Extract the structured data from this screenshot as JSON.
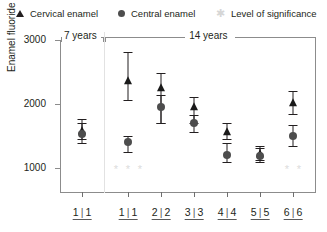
{
  "legend": {
    "items": [
      {
        "marker": "triangle-marker",
        "label": "Cervical enamel"
      },
      {
        "marker": "circle-marker",
        "label": "Central enamel"
      },
      {
        "marker": "asterisk-marker",
        "label": "Level of significance"
      }
    ]
  },
  "axes": {
    "ylabel": "Enamel fluoride (ppm)",
    "yticks": [
      1000,
      2000,
      3000
    ],
    "ytick_labels": [
      "1000",
      "2000",
      "3000"
    ],
    "ylim": [
      600,
      3000
    ],
    "xlim": [
      0,
      7
    ],
    "xtick_labels": [
      "1|1",
      "1|1",
      "2|2",
      "3|3",
      "4|4",
      "5|5",
      "6|6"
    ]
  },
  "groups": [
    {
      "header": "7 years"
    },
    {
      "header": "14 years"
    }
  ],
  "colors": {
    "cervical": "#1a1a1a",
    "central": "#4d4d4d",
    "significance": "#dcdcdc",
    "axis": "#8c8c8c"
  },
  "chart_data": {
    "type": "scatter",
    "title": "",
    "xlabel": "",
    "ylabel": "Enamel fluoride (ppm)",
    "ylim": [
      600,
      3000
    ],
    "grid": false,
    "legend_position": "top",
    "categories": [
      "1|1",
      "1|1",
      "2|2",
      "3|3",
      "4|4",
      "5|5",
      "6|6"
    ],
    "group_headers": [
      "7 years",
      "14 years"
    ],
    "group_spans": [
      [
        0,
        0
      ],
      [
        1,
        6
      ]
    ],
    "series": [
      {
        "name": "Cervical enamel",
        "marker": "triangle",
        "values": [
          1570,
          2350,
          2250,
          1950,
          1550,
          1210,
          2010
        ],
        "err_high": [
          1760,
          2810,
          2480,
          2100,
          1700,
          1330,
          2200
        ],
        "err_low": [
          1440,
          2060,
          1700,
          1700,
          1440,
          1120,
          1840
        ]
      },
      {
        "name": "Central enamel",
        "marker": "circle",
        "values": [
          1520,
          1400,
          1950,
          1700,
          1200,
          1180,
          1500
        ],
        "err_high": [
          1700,
          1500,
          2130,
          1830,
          1380,
          1300,
          1660
        ],
        "err_low": [
          1390,
          1250,
          1700,
          1560,
          1080,
          1080,
          1340
        ]
      }
    ],
    "significance_markers": [
      {
        "category_index": 1,
        "count": 3,
        "symbol": "*"
      },
      {
        "category_index": 6,
        "count": 2,
        "symbol": "*"
      }
    ]
  }
}
